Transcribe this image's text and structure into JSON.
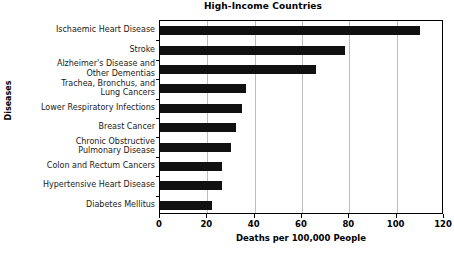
{
  "chart_data": {
    "type": "bar",
    "orientation": "horizontal",
    "title": "High-Income Countries",
    "xlabel": "Deaths per 100,000 People",
    "ylabel": "Diseases",
    "xlim": [
      0,
      120
    ],
    "xticks": [
      0,
      20,
      40,
      60,
      80,
      100,
      120
    ],
    "xtick_labels": [
      "0",
      "20",
      "40",
      "60",
      "80",
      "100",
      "120"
    ],
    "grid": "vertical",
    "legend": "none",
    "bar_color": "#111111",
    "categories": [
      "Ischaemic Heart Disease",
      "Stroke",
      "Alzheimer's Disease and Other Dementias",
      "Trachea, Bronchus, and Lung Cancers",
      "Lower Respiratory Infections",
      "Breast Cancer",
      "Chronic Obstructive Pulmonary Disease",
      "Colon and Rectum Cancers",
      "Hypertensive Heart Disease",
      "Diabetes Mellitus"
    ],
    "category_label_lines": [
      [
        "Ischaemic Heart Disease"
      ],
      [
        "Stroke"
      ],
      [
        "Alzheimer's Disease and",
        "Other Dementias"
      ],
      [
        "Trachea, Bronchus, and",
        "Lung Cancers"
      ],
      [
        "Lower Respiratory Infections"
      ],
      [
        "Breast Cancer"
      ],
      [
        "Chronic Obstructive",
        "Pulmonary Disease"
      ],
      [
        "Colon and Rectum Cancers"
      ],
      [
        "Hypertensive Heart Disease"
      ],
      [
        "Diabetes Mellitus"
      ]
    ],
    "values": [
      110,
      78,
      66,
      36.5,
      34.5,
      32,
      30,
      26,
      26,
      22
    ]
  }
}
